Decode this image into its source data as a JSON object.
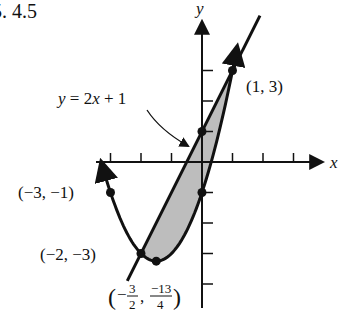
{
  "problem_number": "5. 4.5",
  "axes": {
    "x_label": "x",
    "y_label": "y",
    "origin_px": [
      202,
      162
    ],
    "unit_px": 30.5,
    "x_ticks": [
      -3,
      -2,
      -1,
      1,
      2,
      3
    ],
    "y_ticks": [
      -4,
      -3,
      -2,
      -1,
      1,
      2,
      3
    ]
  },
  "curves": {
    "parabola": {
      "equation": "y = x^2 + 3x - 1",
      "x_range": [
        -3.3,
        1.15
      ]
    },
    "line": {
      "equation": "y = 2x + 1",
      "label": "y = 2x + 1",
      "x_range": [
        -2.45,
        1.9
      ]
    }
  },
  "shaded_region": {
    "between": [
      "line",
      "parabola"
    ],
    "x_range": [
      -2,
      1
    ],
    "fill": "#bdbdbd"
  },
  "points": [
    {
      "x": 1,
      "y": 3,
      "label": "(1, 3)"
    },
    {
      "x": -3,
      "y": -1,
      "label": "(−3, −1)"
    },
    {
      "x": -2,
      "y": -3,
      "label": "(−2, −3)"
    },
    {
      "x": -1.5,
      "y": -3.25,
      "label_open": "(−",
      "label_num1": "3",
      "label_den1": "2",
      "label_num2": "−13",
      "label_den2": "4",
      "label_close": ")"
    },
    {
      "x": 0,
      "y": 1,
      "label": ""
    },
    {
      "x": 0,
      "y": -1,
      "label": ""
    }
  ],
  "colors": {
    "ink": "#111111",
    "shade": "#bdbdbd"
  }
}
